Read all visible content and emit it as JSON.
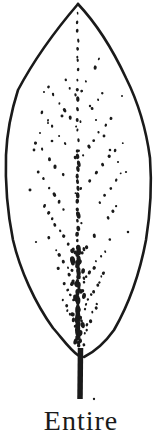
{
  "figure": {
    "caption": "Entire",
    "ink_color": "#1a1a1a",
    "background_color": "#ffffff"
  },
  "drawing": {
    "canvas": {
      "width": 162,
      "height": 429
    },
    "seed": 12,
    "outline_stroke_width": 2.6,
    "outline_left": "M78,4 C60,25 35,58 18,90 C11,112 7,130 6,155 C5,185 8,215 13,240 C20,270 35,303 53,328 C62,338 70,350 79,356",
    "outline_right": "M78,4 C95,22 112,48 126,78 C137,100 146,128 150,158 C152,185 150,215 146,240 C140,272 129,304 114,330 C104,344 94,352 84,357",
    "petiole": {
      "x_top": 80.5,
      "y_top": 348,
      "x_bottom": 80,
      "y_bottom": 399,
      "width": 5.5
    },
    "midrib": {
      "x": 78,
      "segments": [
        {
          "y0": 13,
          "y1": 60,
          "step": 9,
          "r": 1.1
        },
        {
          "y0": 60,
          "y1": 150,
          "step": 10,
          "r": 1.4
        },
        {
          "y0": 150,
          "y1": 248,
          "step": 6.5,
          "r": 1.7
        },
        {
          "y0": 248,
          "y1": 348,
          "step": 3.6,
          "r": 2.1
        }
      ]
    },
    "veins": [
      [
        76,
        96,
        56,
        62,
        5
      ],
      [
        76,
        126,
        48,
        88,
        6
      ],
      [
        75,
        158,
        42,
        112,
        7
      ],
      [
        75,
        192,
        36,
        142,
        7
      ],
      [
        75,
        225,
        38,
        172,
        8
      ],
      [
        76,
        256,
        44,
        206,
        9
      ],
      [
        77,
        286,
        50,
        238,
        9
      ],
      [
        78,
        312,
        57,
        268,
        9
      ],
      [
        79,
        336,
        64,
        300,
        8
      ],
      [
        81,
        90,
        100,
        60,
        5
      ],
      [
        81,
        122,
        108,
        86,
        6
      ],
      [
        82,
        155,
        116,
        112,
        7
      ],
      [
        82,
        188,
        122,
        142,
        7
      ],
      [
        82,
        222,
        121,
        174,
        8
      ],
      [
        83,
        252,
        116,
        206,
        9
      ],
      [
        83,
        283,
        111,
        240,
        9
      ],
      [
        84,
        310,
        104,
        272,
        9
      ],
      [
        84,
        334,
        97,
        304,
        8
      ]
    ],
    "basal_cluster": {
      "y0": 250,
      "y1": 348,
      "step": 5,
      "spread": 6,
      "r_min": 1.2,
      "r_max": 2.6,
      "per_step": 2
    },
    "scatter": [
      [
        44,
        92
      ],
      [
        53,
        94
      ],
      [
        48,
        123
      ],
      [
        40,
        133
      ],
      [
        52,
        141
      ],
      [
        62,
        116
      ],
      [
        34,
        150
      ],
      [
        96,
        120
      ],
      [
        104,
        136
      ],
      [
        90,
        106
      ],
      [
        110,
        150
      ],
      [
        118,
        162
      ],
      [
        30,
        190
      ],
      [
        126,
        172
      ],
      [
        122,
        96
      ],
      [
        36,
        242
      ],
      [
        128,
        232
      ],
      [
        94,
        399
      ]
    ]
  }
}
